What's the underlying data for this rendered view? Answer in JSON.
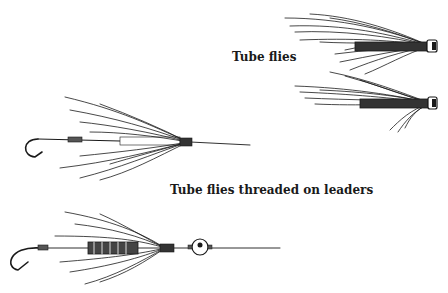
{
  "captions": {
    "tube_flies": "Tube flies",
    "threaded": "Tube flies threaded on leaders"
  },
  "illustrations": [
    {
      "name": "tube-fly-upper",
      "description": "Tube fly with long dark hair wing, pointing right"
    },
    {
      "name": "tube-fly-lower",
      "description": "Tube fly with dark hair wing and hackle, pointing right"
    },
    {
      "name": "threaded-fly-plain",
      "description": "Tube fly threaded on leader with hook at left"
    },
    {
      "name": "threaded-fly-bead",
      "description": "Ribbed tube fly threaded on leader with bead and hook at left"
    }
  ],
  "colors": {
    "ink": "#1a1a1a",
    "background": "#ffffff"
  }
}
